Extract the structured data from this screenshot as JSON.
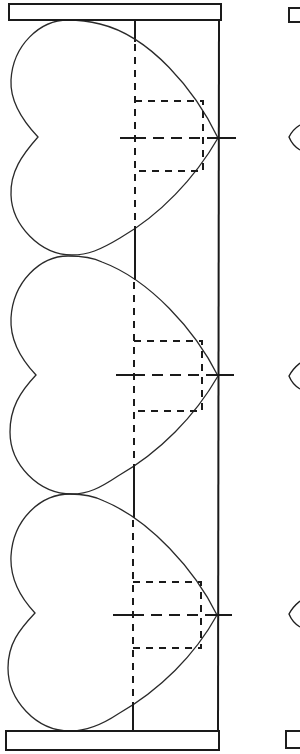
{
  "figure": {
    "colors": {
      "ink": "#1a1a1a",
      "background": "#ffffff"
    },
    "top_bar": {
      "x": 9,
      "y": 4,
      "w": 212,
      "h": 16
    },
    "bottom_bar": {
      "x": 6,
      "y": 731,
      "w": 213,
      "h": 19
    },
    "right_frame_line_x": 218,
    "center_guide_x": 135,
    "hearts": [
      {
        "label": "heart-1",
        "center_y": 138,
        "top_y": 20,
        "bottom_y": 255,
        "tip_x": 218,
        "notch_x": 38,
        "guide_rect": {
          "x": 135,
          "y": 101,
          "w": 68,
          "h": 70
        },
        "cross": {
          "x1": 120,
          "x2": 236
        }
      },
      {
        "label": "heart-2",
        "center_y": 375,
        "top_y": 255,
        "bottom_y": 494,
        "tip_x": 218,
        "notch_x": 36,
        "guide_rect": {
          "x": 134,
          "y": 341,
          "w": 68,
          "h": 70
        },
        "cross": {
          "x1": 116,
          "x2": 234
        }
      },
      {
        "label": "heart-3",
        "center_y": 615,
        "top_y": 494,
        "bottom_y": 731,
        "tip_x": 217,
        "notch_x": 35,
        "guide_rect": {
          "x": 133,
          "y": 582,
          "w": 68,
          "h": 66
        },
        "cross": {
          "x1": 113,
          "x2": 232
        }
      }
    ],
    "right_edge_partial": {
      "top_rect_y": [
        8,
        22
      ],
      "notches_y": [
        137,
        376,
        614
      ],
      "bottom_rect_y": [
        731,
        748
      ]
    }
  }
}
